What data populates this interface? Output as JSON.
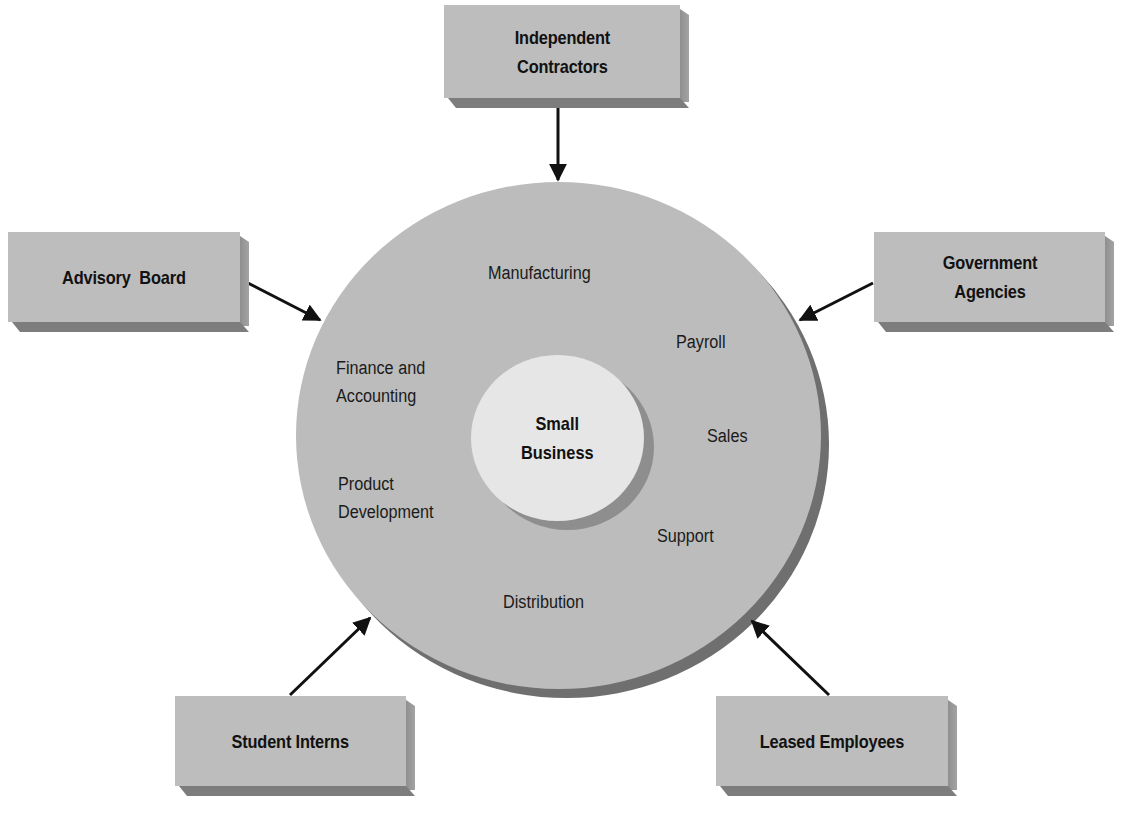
{
  "diagram": {
    "center": {
      "label": "Small\nBusiness"
    },
    "functions": [
      {
        "id": "manufacturing",
        "label": "Manufacturing"
      },
      {
        "id": "payroll",
        "label": "Payroll"
      },
      {
        "id": "finance",
        "label": "Finance and\nAccounting"
      },
      {
        "id": "sales",
        "label": "Sales"
      },
      {
        "id": "product",
        "label": "Product\nDevelopment"
      },
      {
        "id": "support",
        "label": "Support"
      },
      {
        "id": "distribution",
        "label": "Distribution"
      }
    ],
    "resources": [
      {
        "id": "independent-contractors",
        "label": "Independent\nContractors"
      },
      {
        "id": "advisory-board",
        "label": "Advisory  Board"
      },
      {
        "id": "government-agencies",
        "label": "Government\nAgencies"
      },
      {
        "id": "student-interns",
        "label": "Student Interns"
      },
      {
        "id": "leased-employees",
        "label": "Leased Employees"
      }
    ],
    "colors": {
      "box_face": "#bdbdbd",
      "ring": "#bcbcbc",
      "ring_shadow": "#6f6f6f",
      "core": "#e6e6e6",
      "arrow": "#111111"
    }
  }
}
